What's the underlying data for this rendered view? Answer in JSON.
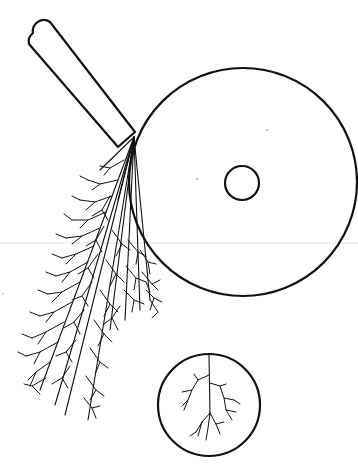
{
  "diagram": {
    "description": "Line drawing: a large disc with a small central hole, a rounded rectangular handle touching its upper-left edge, a fan of branching dendritic (tree-like) discharge lines spreading down-left from the contact point, and a small inset circle below showing a single branching pattern.",
    "colors": {
      "ink": "#111111",
      "background": "#ffffff",
      "guide_line": "#dddddd"
    },
    "elements": {
      "large_disc": {
        "cx": 243,
        "cy": 182,
        "r": 114
      },
      "center_hole": {
        "cx": 242,
        "cy": 183,
        "r": 17
      },
      "handle": {
        "top": [
          40,
          24
        ],
        "bottom_contact": [
          134,
          135
        ],
        "width": 22
      },
      "fan_origin": [
        134,
        137
      ],
      "inset_circle": {
        "cx": 209,
        "cy": 405,
        "r": 51
      }
    },
    "labels": []
  }
}
